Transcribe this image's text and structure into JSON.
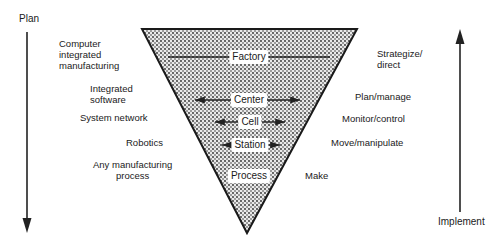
{
  "axes": {
    "left_label": "Plan",
    "right_label": "Implement"
  },
  "pyramid": {
    "levels": [
      {
        "name": "Factory"
      },
      {
        "name": "Center"
      },
      {
        "name": "Cell"
      },
      {
        "name": "Station"
      },
      {
        "name": "Process"
      }
    ]
  },
  "left_column": [
    {
      "text": "Computer\nintegrated\nmanufacturing"
    },
    {
      "text": "Integrated\nsoftware"
    },
    {
      "text": "System network"
    },
    {
      "text": "Robotics"
    },
    {
      "text": "Any manufacturing\nprocess"
    }
  ],
  "right_column": [
    {
      "text": "Strategize/\ndirect"
    },
    {
      "text": "Plan/manage"
    },
    {
      "text": "Monitor/control"
    },
    {
      "text": "Move/manipulate"
    },
    {
      "text": "Make"
    }
  ]
}
